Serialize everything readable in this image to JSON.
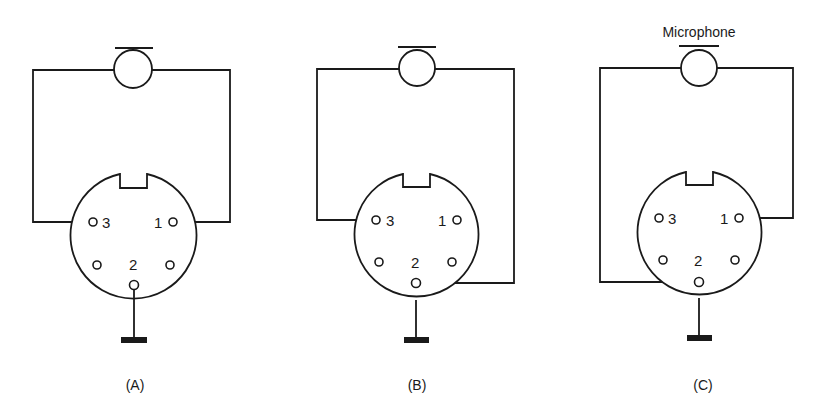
{
  "figure": {
    "microphone_label": "Microphone",
    "panels": [
      {
        "id": "A",
        "caption": "(A)",
        "pin_labels": {
          "p1": "1",
          "p2": "2",
          "p3": "3"
        },
        "wiring": "Mic connects to pin 3 and pin 1; pin 2 grounded"
      },
      {
        "id": "B",
        "caption": "(B)",
        "pin_labels": {
          "p1": "1",
          "p2": "2",
          "p3": "3"
        },
        "wiring": "Mic connects to pin 3 and pin 2; shell grounded"
      },
      {
        "id": "C",
        "caption": "(C)",
        "pin_labels": {
          "p1": "1",
          "p2": "2",
          "p3": "3"
        },
        "wiring": "Mic connects to pin 2 and pin 1; shell grounded"
      }
    ]
  },
  "colors": {
    "line": "#1a1a1a",
    "background": "#ffffff"
  }
}
